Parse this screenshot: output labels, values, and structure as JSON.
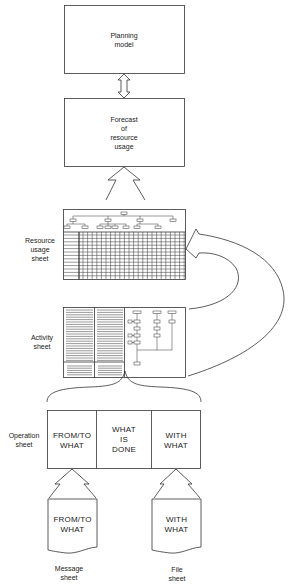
{
  "diagram": {
    "planning_box": {
      "line1": "Planning",
      "line2": "model"
    },
    "forecast_box": {
      "line1": "Forecast",
      "line2": "of",
      "line3": "resource",
      "line4": "usage"
    },
    "resource_sheet": {
      "label1": "Resource",
      "label2": "usage",
      "label3": "sheet"
    },
    "activity_sheet": {
      "label1": "Activity",
      "label2": "sheet"
    },
    "operation_sheet": {
      "label1": "Operation",
      "label2": "sheet",
      "columns": [
        {
          "line1": "FROM/TO",
          "line2": "WHAT"
        },
        {
          "line1": "WHAT",
          "line2": "IS",
          "line3": "DONE"
        },
        {
          "line1": "WITH",
          "line2": "WHAT"
        }
      ]
    },
    "message_sheet": {
      "line1": "FROM/TO",
      "line2": "WHAT",
      "caption1": "Message",
      "caption2": "sheet"
    },
    "file_sheet": {
      "line1": "WITH",
      "line2": "WHAT",
      "caption1": "File",
      "caption2": "sheet"
    },
    "colors": {
      "line": "#333333",
      "background": "#ffffff"
    }
  }
}
